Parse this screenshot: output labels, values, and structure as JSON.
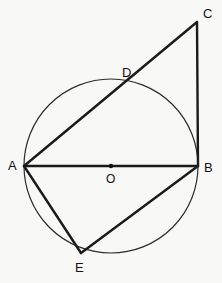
{
  "figure": {
    "type": "euclidean-geometry-diagram",
    "width": 222,
    "height": 283,
    "background_color": "#f8f8f7",
    "stroke_color": "#1a1a1a",
    "circle_stroke_color": "#2b2b2b"
  },
  "circle": {
    "name": "main-circle",
    "center_x": 111,
    "center_y": 166,
    "radius": 87,
    "stroke_width": 1.2,
    "fill": "none"
  },
  "points": [
    {
      "id": "A",
      "label": "A",
      "x": 24,
      "y": 166,
      "label_x": 8,
      "label_y": 159,
      "on_circle": true
    },
    {
      "id": "B",
      "label": "B",
      "x": 198,
      "y": 166,
      "label_x": 204,
      "label_y": 161,
      "on_circle": true
    },
    {
      "id": "C",
      "label": "C",
      "x": 197,
      "y": 22,
      "label_x": 203,
      "label_y": 7,
      "on_circle": false
    },
    {
      "id": "D",
      "label": "D",
      "x": 131,
      "y": 84,
      "label_x": 122,
      "label_y": 66,
      "on_circle": true
    },
    {
      "id": "E",
      "label": "E",
      "x": 81,
      "y": 253,
      "label_x": 75,
      "label_y": 261,
      "on_circle": true
    },
    {
      "id": "O",
      "label": "O",
      "x": 111,
      "y": 166,
      "label_x": 106,
      "label_y": 173,
      "on_circle": false
    }
  ],
  "center_dot": {
    "name": "center-point-O",
    "x": 111,
    "y": 166,
    "radius": 2.2,
    "fill": "#111111"
  },
  "segments": [
    {
      "id": "AB",
      "name": "segment-a-b",
      "from": "A",
      "to": "B",
      "x1": 24,
      "y1": 166,
      "x2": 198,
      "y2": 166,
      "stroke_width": 2.4,
      "role": "diameter"
    },
    {
      "id": "AC",
      "name": "segment-a-c",
      "from": "A",
      "to": "C",
      "x1": 24,
      "y1": 166,
      "x2": 197,
      "y2": 22,
      "stroke_width": 2.4,
      "role": "secant-through-D"
    },
    {
      "id": "CB",
      "name": "segment-c-b",
      "from": "C",
      "to": "B",
      "x1": 197,
      "y1": 22,
      "x2": 198,
      "y2": 166,
      "stroke_width": 2.4,
      "role": "tangent-perpendicular"
    },
    {
      "id": "AE",
      "name": "segment-a-e",
      "from": "A",
      "to": "E",
      "x1": 24,
      "y1": 166,
      "x2": 81,
      "y2": 253,
      "stroke_width": 2.4,
      "role": "chord"
    },
    {
      "id": "EB",
      "name": "segment-e-b",
      "from": "E",
      "to": "B",
      "x1": 81,
      "y1": 253,
      "x2": 198,
      "y2": 166,
      "stroke_width": 2.4,
      "role": "chord"
    }
  ],
  "labels": {
    "A": "A",
    "B": "B",
    "C": "C",
    "D": "D",
    "E": "E",
    "O": "O"
  }
}
